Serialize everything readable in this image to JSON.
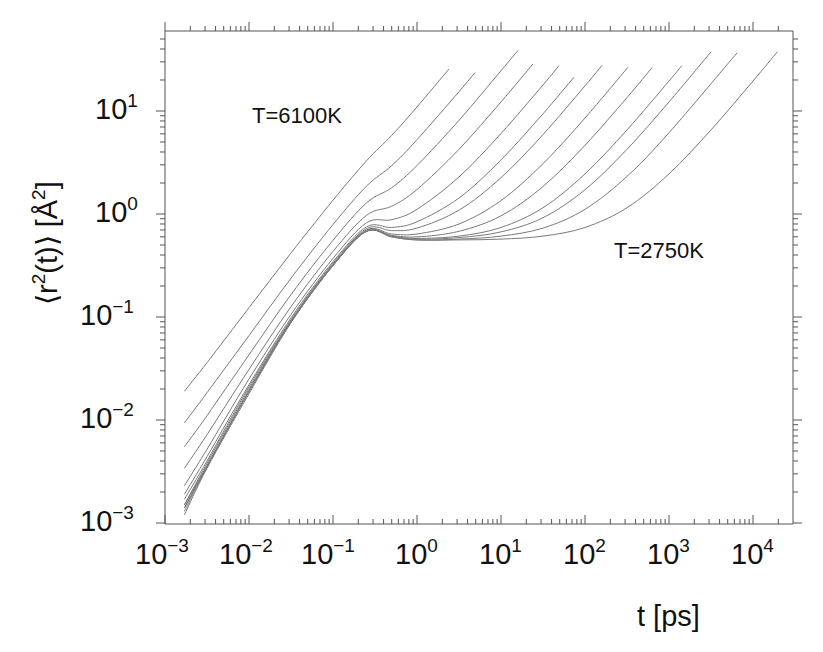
{
  "chart_data": {
    "type": "line",
    "title": "",
    "xlabel": "t [ps]",
    "ylabel": "⟨r²(t)⟩ [Å²]",
    "xscale": "log",
    "yscale": "log",
    "xlim": [
      0.001,
      30000
    ],
    "ylim": [
      0.001,
      60
    ],
    "grid": false,
    "legend": null,
    "xticks": [
      "10^-3",
      "10^-2",
      "10^-1",
      "10^0",
      "10^1",
      "10^2",
      "10^3",
      "10^4"
    ],
    "yticks": [
      "10^-3",
      "10^-2",
      "10^-1",
      "10^0",
      "10^1"
    ],
    "annotations": [
      {
        "text": "T=6100K",
        "x": 0.05,
        "y": 12
      },
      {
        "text": "T=2750K",
        "x": 1500,
        "y": 0.35
      }
    ],
    "series": [
      {
        "name": "curve-1 (T=6100K)",
        "points": [
          [
            0.0017,
            0.019
          ],
          [
            0.00316,
            0.036
          ],
          [
            0.01,
            0.123
          ],
          [
            0.0316,
            0.418
          ],
          [
            0.1,
            1.36
          ],
          [
            0.25,
            3.28
          ],
          [
            0.5,
            5.8
          ],
          [
            1,
            10.96
          ],
          [
            2.4,
            25.5
          ]
        ]
      },
      {
        "name": "curve-2",
        "points": [
          [
            0.0017,
            0.0094
          ],
          [
            0.00316,
            0.0184
          ],
          [
            0.01,
            0.066
          ],
          [
            0.0316,
            0.238
          ],
          [
            0.1,
            0.79
          ],
          [
            0.25,
            1.86
          ],
          [
            0.5,
            2.95
          ],
          [
            1,
            5.26
          ],
          [
            3.16,
            15.4
          ],
          [
            4.9,
            23.6
          ]
        ]
      },
      {
        "name": "curve-3",
        "points": [
          [
            0.0017,
            0.0055
          ],
          [
            0.00316,
            0.011
          ],
          [
            0.01,
            0.043
          ],
          [
            0.0316,
            0.165
          ],
          [
            0.1,
            0.556
          ],
          [
            0.25,
            1.28
          ],
          [
            0.5,
            1.8
          ],
          [
            1,
            2.96
          ],
          [
            3.16,
            8.1
          ],
          [
            10,
            24.6
          ],
          [
            16,
            38.9
          ]
        ]
      },
      {
        "name": "curve-4",
        "points": [
          [
            0.0017,
            0.0034
          ],
          [
            0.00316,
            0.0072
          ],
          [
            0.01,
            0.031
          ],
          [
            0.0316,
            0.126
          ],
          [
            0.1,
            0.433
          ],
          [
            0.25,
            0.97
          ],
          [
            0.5,
            1.19
          ],
          [
            1,
            1.73
          ],
          [
            3.16,
            4.25
          ],
          [
            10,
            12.25
          ],
          [
            24,
            28.6
          ]
        ]
      },
      {
        "name": "curve-5",
        "points": [
          [
            0.0017,
            0.0023
          ],
          [
            0.00316,
            0.0052
          ],
          [
            0.01,
            0.025
          ],
          [
            0.0316,
            0.106
          ],
          [
            0.1,
            0.371
          ],
          [
            0.25,
            0.82
          ],
          [
            0.5,
            0.88
          ],
          [
            1,
            1.11
          ],
          [
            3.16,
            2.29
          ],
          [
            10,
            6.05
          ],
          [
            31.6,
            17.9
          ],
          [
            49,
            27.5
          ]
        ]
      },
      {
        "name": "curve-6",
        "points": [
          [
            0.0017,
            0.0019
          ],
          [
            0.00316,
            0.0044
          ],
          [
            0.01,
            0.022
          ],
          [
            0.0316,
            0.098
          ],
          [
            0.1,
            0.344
          ],
          [
            0.25,
            0.75
          ],
          [
            0.5,
            0.74
          ],
          [
            1,
            0.84
          ],
          [
            3.16,
            1.43
          ],
          [
            10,
            3.35
          ],
          [
            31.6,
            9.4
          ],
          [
            74,
            21.3
          ]
        ]
      },
      {
        "name": "curve-7",
        "points": [
          [
            0.0017,
            0.0017
          ],
          [
            0.00316,
            0.004
          ],
          [
            0.01,
            0.021
          ],
          [
            0.0316,
            0.094
          ],
          [
            0.1,
            0.333
          ],
          [
            0.25,
            0.72
          ],
          [
            0.5,
            0.69
          ],
          [
            1,
            0.73
          ],
          [
            3.16,
            1.09
          ],
          [
            10,
            2.25
          ],
          [
            31.6,
            5.9
          ],
          [
            100,
            17.55
          ],
          [
            160,
            27.8
          ]
        ]
      },
      {
        "name": "curve-8",
        "points": [
          [
            0.0017,
            0.0015
          ],
          [
            0.00316,
            0.0038
          ],
          [
            0.01,
            0.02
          ],
          [
            0.0316,
            0.092
          ],
          [
            0.1,
            0.324
          ],
          [
            0.25,
            0.7
          ],
          [
            0.5,
            0.64
          ],
          [
            1,
            0.64
          ],
          [
            3.16,
            0.8
          ],
          [
            10,
            1.35
          ],
          [
            31.6,
            3.08
          ],
          [
            100,
            8.55
          ],
          [
            325,
            26.6
          ]
        ]
      },
      {
        "name": "curve-9",
        "points": [
          [
            0.0017,
            0.0015
          ],
          [
            0.00316,
            0.0036
          ],
          [
            0.01,
            0.019
          ],
          [
            0.0316,
            0.09
          ],
          [
            0.1,
            0.32
          ],
          [
            0.25,
            0.69
          ],
          [
            0.5,
            0.62
          ],
          [
            1,
            0.6
          ],
          [
            3.16,
            0.68
          ],
          [
            10,
            0.96
          ],
          [
            31.6,
            1.85
          ],
          [
            100,
            4.65
          ],
          [
            316,
            13.5
          ],
          [
            630,
            26.4
          ]
        ]
      },
      {
        "name": "curve-10",
        "points": [
          [
            0.0017,
            0.0014
          ],
          [
            0.00316,
            0.0036
          ],
          [
            0.01,
            0.019
          ],
          [
            0.0316,
            0.09
          ],
          [
            0.1,
            0.318
          ],
          [
            0.25,
            0.68
          ],
          [
            0.5,
            0.61
          ],
          [
            1,
            0.58
          ],
          [
            3.16,
            0.61
          ],
          [
            10,
            0.74
          ],
          [
            31.6,
            1.15
          ],
          [
            100,
            2.45
          ],
          [
            316,
            6.55
          ],
          [
            1000,
            19.55
          ],
          [
            1420,
            27.5
          ]
        ]
      },
      {
        "name": "curve-11",
        "points": [
          [
            0.0017,
            0.0014
          ],
          [
            0.00316,
            0.0035
          ],
          [
            0.01,
            0.019
          ],
          [
            0.0316,
            0.089
          ],
          [
            0.1,
            0.317
          ],
          [
            0.25,
            0.68
          ],
          [
            0.5,
            0.61
          ],
          [
            1,
            0.57
          ],
          [
            3.16,
            0.59
          ],
          [
            10,
            0.67
          ],
          [
            31.6,
            0.92
          ],
          [
            100,
            1.72
          ],
          [
            316,
            4.25
          ],
          [
            1000,
            12.25
          ],
          [
            3160,
            37.5
          ]
        ]
      },
      {
        "name": "curve-12",
        "points": [
          [
            0.0017,
            0.0013
          ],
          [
            0.00316,
            0.0035
          ],
          [
            0.01,
            0.019
          ],
          [
            0.0316,
            0.089
          ],
          [
            0.1,
            0.316
          ],
          [
            0.25,
            0.68
          ],
          [
            0.5,
            0.6
          ],
          [
            1,
            0.56
          ],
          [
            3.16,
            0.57
          ],
          [
            10,
            0.61
          ],
          [
            31.6,
            0.73
          ],
          [
            100,
            1.11
          ],
          [
            316,
            2.32
          ],
          [
            1000,
            6.15
          ],
          [
            6460,
            36.7
          ]
        ]
      },
      {
        "name": "curve-13 (T=2750K)",
        "points": [
          [
            0.0017,
            0.0012
          ],
          [
            0.00316,
            0.0034
          ],
          [
            0.01,
            0.018
          ],
          [
            0.0316,
            0.088
          ],
          [
            0.1,
            0.315
          ],
          [
            0.25,
            0.68
          ],
          [
            0.5,
            0.6
          ],
          [
            1,
            0.56
          ],
          [
            3.16,
            0.56
          ],
          [
            10,
            0.57
          ],
          [
            31.6,
            0.61
          ],
          [
            100,
            0.74
          ],
          [
            316,
            1.15
          ],
          [
            1000,
            2.45
          ],
          [
            3162,
            6.56
          ],
          [
            10000,
            19.55
          ],
          [
            19500,
            37.6
          ]
        ]
      }
    ]
  },
  "labels": {
    "x_ticks": [
      {
        "base": "10",
        "exp": "−3"
      },
      {
        "base": "10",
        "exp": "−2"
      },
      {
        "base": "10",
        "exp": "−1"
      },
      {
        "base": "10",
        "exp": "0"
      },
      {
        "base": "10",
        "exp": "1"
      },
      {
        "base": "10",
        "exp": "2"
      },
      {
        "base": "10",
        "exp": "3"
      },
      {
        "base": "10",
        "exp": "4"
      }
    ],
    "y_ticks": [
      {
        "base": "10",
        "exp": "1"
      },
      {
        "base": "10",
        "exp": "0"
      },
      {
        "base": "10",
        "exp": "−1"
      },
      {
        "base": "10",
        "exp": "−2"
      },
      {
        "base": "10",
        "exp": "−3"
      }
    ],
    "xlabel": "t [ps]",
    "ylabel_main": "⟨r",
    "ylabel_sup": "2",
    "ylabel_mid": "(t)⟩ [Å",
    "ylabel_sup2": "2",
    "ylabel_end": "]",
    "annot_hot": "T=6100K",
    "annot_cold": "T=2750K"
  },
  "style": {
    "line_color": "#7a7a7a",
    "axis_color": "#555555",
    "text_color": "#111111"
  }
}
